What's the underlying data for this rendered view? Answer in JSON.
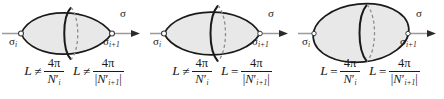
{
  "figure": {
    "colors": {
      "outline": "#1a1a1a",
      "fill": "#e8e8e8",
      "axis": "#9a9a9a",
      "dashed": "#8c8c8c",
      "text": "#1a1a1a",
      "background": "#ffffff"
    },
    "panel_count": 3
  },
  "panels": [
    {
      "id": "panel-1",
      "shape": "lens",
      "left_endpoint_shape": "cusp",
      "right_endpoint_shape": "cusp",
      "axis_label": "σ",
      "left_vertex_label": "σ",
      "left_vertex_sub": "i",
      "right_vertex_label": "σ",
      "right_vertex_sub": "i+1",
      "formula_left": {
        "lhs": "L",
        "relation": "≠",
        "numerator": "4π",
        "denominator_base": "N",
        "denominator_prime": "′",
        "denominator_sub": "i",
        "abs": false
      },
      "formula_right": {
        "lhs": "L",
        "relation": "≠",
        "numerator": "4π",
        "denominator_base": "N",
        "denominator_prime": "′",
        "denominator_sub": "i+1",
        "abs": true,
        "abs_open": "|",
        "abs_close": "|"
      }
    },
    {
      "id": "panel-2",
      "shape": "teardrop",
      "left_endpoint_shape": "cusp",
      "right_endpoint_shape": "round",
      "axis_label": "σ",
      "left_vertex_label": "σ",
      "left_vertex_sub": "i",
      "right_vertex_label": "σ",
      "right_vertex_sub": "i+1",
      "formula_left": {
        "lhs": "L",
        "relation": "≠",
        "numerator": "4π",
        "denominator_base": "N",
        "denominator_prime": "′",
        "denominator_sub": "i",
        "abs": false
      },
      "formula_right": {
        "lhs": "L",
        "relation": "=",
        "numerator": "4π",
        "denominator_base": "N",
        "denominator_prime": "′",
        "denominator_sub": "i+1",
        "abs": true,
        "abs_open": "|",
        "abs_close": "|"
      }
    },
    {
      "id": "panel-3",
      "shape": "ellipse",
      "left_endpoint_shape": "round",
      "right_endpoint_shape": "round",
      "axis_label": "σ",
      "left_vertex_label": "σ",
      "left_vertex_sub": "i",
      "right_vertex_label": "σ",
      "right_vertex_sub": "i+1",
      "formula_left": {
        "lhs": "L",
        "relation": "=",
        "numerator": "4π",
        "denominator_base": "N",
        "denominator_prime": "′",
        "denominator_sub": "i",
        "abs": false
      },
      "formula_right": {
        "lhs": "L",
        "relation": "=",
        "numerator": "4π",
        "denominator_base": "N",
        "denominator_prime": "′",
        "denominator_sub": "i+1",
        "abs": true,
        "abs_open": "|",
        "abs_close": "|"
      }
    }
  ]
}
